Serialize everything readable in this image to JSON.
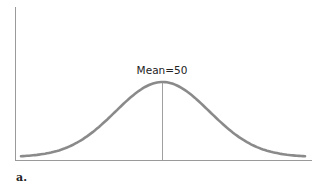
{
  "chart_data": {
    "type": "line",
    "title": "",
    "xlabel": "",
    "ylabel": "",
    "annotation": "Mean=50",
    "mean": 50,
    "panel_label": "a.",
    "distribution": "normal",
    "grid": false,
    "legend": null,
    "x": [
      0,
      10,
      20,
      30,
      40,
      50,
      60,
      70,
      80,
      90,
      100
    ],
    "values": [
      0.02,
      0.07,
      0.2,
      0.45,
      0.8,
      1.0,
      0.8,
      0.45,
      0.2,
      0.07,
      0.02
    ],
    "colors": {
      "curve": "#8a8a8a",
      "axis": "#9a9a9a",
      "mean_line": "#a0a0a0"
    }
  }
}
